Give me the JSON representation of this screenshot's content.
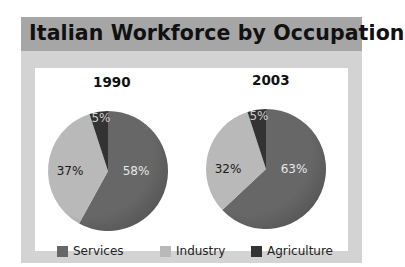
{
  "title": "Italian Workforce by Occupation",
  "colors": {
    "services": "#676767",
    "industry": "#b9b9b9",
    "agriculture": "#333333",
    "panel_bg": "#d3d3d3",
    "title_bar": "#a6a6a6"
  },
  "legend": [
    {
      "label": "Services",
      "color": "#676767"
    },
    {
      "label": "Industry",
      "color": "#b9b9b9"
    },
    {
      "label": "Agriculture",
      "color": "#333333"
    }
  ],
  "charts": [
    {
      "year": "1990",
      "labels": {
        "services": "58%",
        "industry": "37%",
        "agriculture": "5%"
      }
    },
    {
      "year": "2003",
      "labels": {
        "services": "63%",
        "industry": "32%",
        "agriculture": "5%"
      }
    }
  ],
  "chart_data": [
    {
      "type": "pie",
      "title": "1990",
      "categories": [
        "Services",
        "Industry",
        "Agriculture"
      ],
      "values": [
        58,
        37,
        5
      ],
      "unit": "%",
      "colors": [
        "#676767",
        "#b9b9b9",
        "#333333"
      ],
      "legend_position": "bottom"
    },
    {
      "type": "pie",
      "title": "2003",
      "categories": [
        "Services",
        "Industry",
        "Agriculture"
      ],
      "values": [
        63,
        32,
        5
      ],
      "unit": "%",
      "colors": [
        "#676767",
        "#b9b9b9",
        "#333333"
      ],
      "legend_position": "bottom"
    }
  ],
  "figure_title": "Italian Workforce by Occupation"
}
